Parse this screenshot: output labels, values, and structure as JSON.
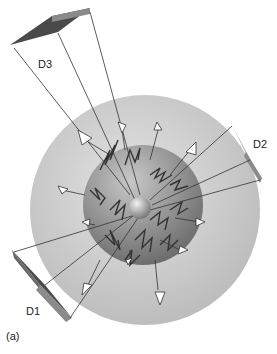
{
  "figure": {
    "panel_label": "(a)",
    "detectors": [
      {
        "id": "D1",
        "label": "D1"
      },
      {
        "id": "D2",
        "label": "D2"
      },
      {
        "id": "D3",
        "label": "D3"
      }
    ],
    "colors": {
      "outer_sphere": "#c9c9c9",
      "inner_sphere": "#8f8f8f",
      "core_sphere": "#b0b0b0",
      "detector_dark": "#4a4a4a",
      "detector_light": "#8a8a8a",
      "lines": "#333333",
      "arrows": "#ffffff"
    }
  }
}
